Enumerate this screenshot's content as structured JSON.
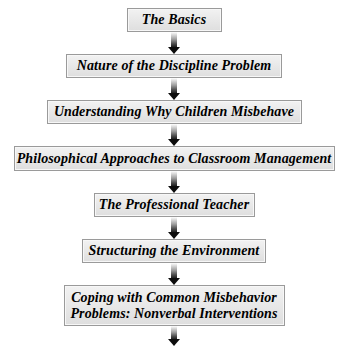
{
  "chart_data": {
    "type": "diagram",
    "subtype": "vertical-flowchart",
    "title": "",
    "orientation": "top-to-bottom",
    "node_count": 7,
    "connector_count": 7,
    "nodes": [
      {
        "id": "basics",
        "lines": [
          "The Basics"
        ]
      },
      {
        "id": "nature",
        "lines": [
          "Nature of the Discipline Problem"
        ]
      },
      {
        "id": "understand",
        "lines": [
          "Understanding Why Children Misbehave"
        ]
      },
      {
        "id": "philosophies",
        "lines": [
          "Philosophical Approaches to Classroom Management"
        ]
      },
      {
        "id": "professional",
        "lines": [
          "The Professional Teacher"
        ]
      },
      {
        "id": "structuring",
        "lines": [
          "Structuring the Environment"
        ]
      },
      {
        "id": "coping",
        "lines": [
          "Coping with Common Misbehavior",
          "Problems: Nonverbal Interventions"
        ]
      }
    ],
    "edges": [
      {
        "from": "basics",
        "to": "nature",
        "style": "gradient-arrow-down"
      },
      {
        "from": "nature",
        "to": "understand",
        "style": "gradient-arrow-down"
      },
      {
        "from": "understand",
        "to": "philosophies",
        "style": "gradient-arrow-down"
      },
      {
        "from": "philosophies",
        "to": "professional",
        "style": "gradient-arrow-down"
      },
      {
        "from": "professional",
        "to": "structuring",
        "style": "gradient-arrow-down"
      },
      {
        "from": "structuring",
        "to": "coping",
        "style": "gradient-arrow-down"
      },
      {
        "from": "coping",
        "to": null,
        "style": "gradient-arrow-down-clipped"
      }
    ]
  },
  "diagram": {
    "background_color": "#ffffff",
    "node_fill_color": "#e9e9e9",
    "node_border_color": "#9a9a9a",
    "arrow_color": "#101010",
    "text_color": "#000000",
    "nodes": {
      "basics": {
        "label": "The Basics"
      },
      "nature": {
        "label": "Nature of the Discipline Problem"
      },
      "understand": {
        "label": "Understanding Why Children Misbehave"
      },
      "philosophies": {
        "label": "Philosophical Approaches to Classroom Management"
      },
      "professional": {
        "label": "The Professional Teacher"
      },
      "structuring": {
        "label": "Structuring the Environment"
      },
      "coping": {
        "label_line1": "Coping with Common Misbehavior",
        "label_line2": "Problems: Nonverbal Interventions"
      }
    }
  }
}
